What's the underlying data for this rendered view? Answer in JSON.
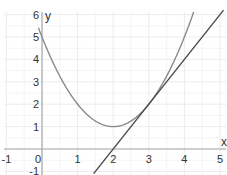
{
  "chart_data": {
    "type": "line",
    "title": "",
    "xlabel": "x",
    "ylabel": "y",
    "xlim": [
      -1,
      5
    ],
    "ylim": [
      -1,
      6
    ],
    "x_ticks": [
      -1,
      0,
      1,
      2,
      3,
      4,
      5
    ],
    "y_ticks": [
      -1,
      1,
      2,
      3,
      4,
      5,
      6
    ],
    "grid": true,
    "legend": null,
    "series": [
      {
        "name": "parabola",
        "expression": "y = x^2 - 4x + 5",
        "color": "#8a8a8a",
        "x": [
          -0.1,
          0,
          0.5,
          1,
          1.5,
          2,
          2.5,
          3,
          3.5,
          4,
          4.4
        ],
        "values": [
          5.41,
          5,
          3.25,
          2,
          1.25,
          1,
          1.25,
          2,
          3.25,
          5,
          6.76
        ]
      },
      {
        "name": "tangent line at x=3",
        "expression": "y = 2x - 4",
        "color": "#4a4a4a",
        "x": [
          1.5,
          2,
          3,
          4,
          5
        ],
        "values": [
          -1,
          0,
          2,
          4,
          6
        ]
      }
    ]
  },
  "axes": {
    "x_label": "x",
    "y_label": "y",
    "x_tick_labels": [
      "-1",
      "0",
      "1",
      "2",
      "3",
      "4",
      "5"
    ],
    "y_tick_labels": [
      "6",
      "5",
      "4",
      "3",
      "2",
      "1",
      "-1"
    ]
  },
  "colors": {
    "grid": "#ececec",
    "axis": "#a8a8a8",
    "curve": "#8a8a8a",
    "tangent": "#4a4a4a"
  }
}
